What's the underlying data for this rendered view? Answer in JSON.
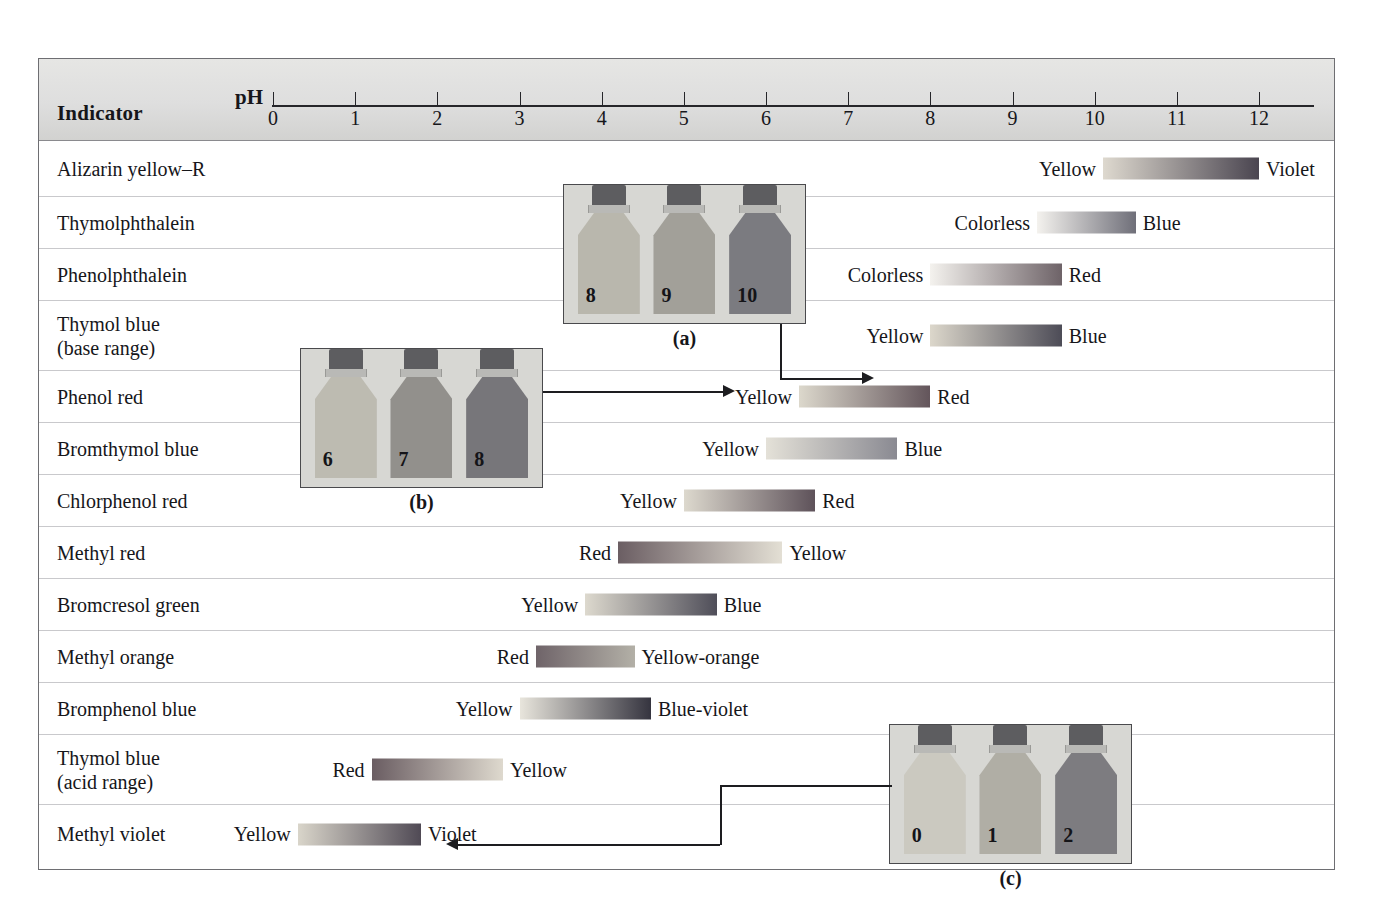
{
  "figure": {
    "header": {
      "indicator_label": "Indicator",
      "ph_label": "pH"
    },
    "axis": {
      "ticks": [
        "0",
        "1",
        "2",
        "3",
        "4",
        "5",
        "6",
        "7",
        "8",
        "9",
        "10",
        "11",
        "12"
      ],
      "min": 0,
      "max": 12,
      "x_start_px": 272,
      "x_end_px": 1258
    }
  },
  "chart_data": {
    "type": "bar",
    "xlabel": "pH",
    "ylabel": "Indicator",
    "xlim": [
      0,
      12
    ],
    "grid": false,
    "legend": "none",
    "categories": [
      "Alizarin yellow–R",
      "Thymolphthalein",
      "Phenolphthalein",
      "Thymol blue\n(base range)",
      "Phenol red",
      "Bromthymol blue",
      "Chlorphenol red",
      "Methyl red",
      "Bromcresol green",
      "Methyl orange",
      "Bromphenol blue",
      "Thymol blue\n(acid range)",
      "Methyl violet"
    ],
    "rows": [
      {
        "indicator": "Alizarin yellow–R",
        "acid_color": "Yellow",
        "base_color": "Violet",
        "ph_low": 10.1,
        "ph_high": 12.0,
        "bar_from": "#ded9cf",
        "bar_to": "#4a4550"
      },
      {
        "indicator": "Thymolphthalein",
        "acid_color": "Colorless",
        "base_color": "Blue",
        "ph_low": 9.3,
        "ph_high": 10.5,
        "bar_from": "#f4f2ee",
        "bar_to": "#6f6f79"
      },
      {
        "indicator": "Phenolphthalein",
        "acid_color": "Colorless",
        "base_color": "Red",
        "ph_low": 8.0,
        "ph_high": 9.6,
        "bar_from": "#f4f2ee",
        "bar_to": "#6e6368"
      },
      {
        "indicator": "Thymol blue\n(base range)",
        "acid_color": "Yellow",
        "base_color": "Blue",
        "ph_low": 8.0,
        "ph_high": 9.6,
        "bar_from": "#dcd7cb",
        "bar_to": "#4d4c57"
      },
      {
        "indicator": "Phenol red",
        "acid_color": "Yellow",
        "base_color": "Red",
        "ph_low": 6.4,
        "ph_high": 8.0,
        "bar_from": "#dcd8cc",
        "bar_to": "#63555b"
      },
      {
        "indicator": "Bromthymol blue",
        "acid_color": "Yellow",
        "base_color": "Blue",
        "ph_low": 6.0,
        "ph_high": 7.6,
        "bar_from": "#e4e1d8",
        "bar_to": "#8a8a92"
      },
      {
        "indicator": "Chlorphenol red",
        "acid_color": "Yellow",
        "base_color": "Red",
        "ph_low": 5.0,
        "ph_high": 6.6,
        "bar_from": "#ddd9ce",
        "bar_to": "#5e525a"
      },
      {
        "indicator": "Methyl red",
        "acid_color": "Red",
        "base_color": "Yellow",
        "ph_low": 4.2,
        "ph_high": 6.2,
        "bar_from": "#6b5e63",
        "bar_to": "#e3dfd4"
      },
      {
        "indicator": "Bromcresol green",
        "acid_color": "Yellow",
        "base_color": "Blue",
        "ph_low": 3.8,
        "ph_high": 5.4,
        "bar_from": "#ddd9ce",
        "bar_to": "#4f4e59"
      },
      {
        "indicator": "Methyl orange",
        "acid_color": "Red",
        "base_color": "Yellow-orange",
        "ph_low": 3.2,
        "ph_high": 4.4,
        "bar_from": "#6f6469",
        "bar_to": "#b3b0a7"
      },
      {
        "indicator": "Bromphenol blue",
        "acid_color": "Yellow",
        "base_color": "Blue-violet",
        "ph_low": 3.0,
        "ph_high": 4.6,
        "bar_from": "#e8e5dc",
        "bar_to": "#35343f"
      },
      {
        "indicator": "Thymol blue\n(acid range)",
        "acid_color": "Red",
        "base_color": "Yellow",
        "ph_low": 1.2,
        "ph_high": 2.8,
        "bar_from": "#6a5d62",
        "bar_to": "#ded9ce"
      },
      {
        "indicator": "Methyl violet",
        "acid_color": "Yellow",
        "base_color": "Violet",
        "ph_low": 0.3,
        "ph_high": 1.8,
        "bar_from": "#d9d5ca",
        "bar_to": "#504a55"
      }
    ]
  },
  "photos": [
    {
      "id": "a",
      "caption": "(a)",
      "bottles": [
        {
          "label": "8",
          "fill": "#b9b7ad"
        },
        {
          "label": "9",
          "fill": "#a2a099"
        },
        {
          "label": "10",
          "fill": "#7b7b80"
        }
      ]
    },
    {
      "id": "b",
      "caption": "(b)",
      "bottles": [
        {
          "label": "6",
          "fill": "#bdbbb1"
        },
        {
          "label": "7",
          "fill": "#92908c"
        },
        {
          "label": "8",
          "fill": "#77767a"
        }
      ]
    },
    {
      "id": "c",
      "caption": "(c)",
      "bottles": [
        {
          "label": "0",
          "fill": "#cbc9c0"
        },
        {
          "label": "1",
          "fill": "#b0aea5"
        },
        {
          "label": "2",
          "fill": "#7d7c80"
        }
      ]
    }
  ]
}
